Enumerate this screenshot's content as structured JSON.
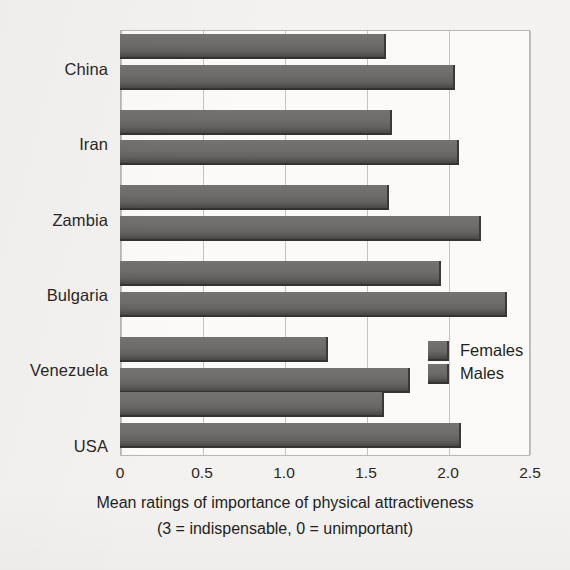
{
  "chart_data": {
    "type": "bar",
    "orientation": "horizontal",
    "title": "",
    "xlabel": "Mean ratings of importance of physical attractiveness",
    "xlabel_line2": "(3 = indispensable, 0 = unimportant)",
    "ylabel": "",
    "xlim": [
      0,
      2.5
    ],
    "xticks": [
      "0",
      "0.5",
      "1.0",
      "1.5",
      "2.0",
      "2.5"
    ],
    "xtick_values": [
      0,
      0.5,
      1.0,
      1.5,
      2.0,
      2.5
    ],
    "grid": true,
    "grid_axis": "x",
    "legend_position": "inside-right",
    "categories": [
      "China",
      "Iran",
      "Zambia",
      "Bulgaria",
      "Venezuela",
      "USA"
    ],
    "series": [
      {
        "name": "Females",
        "values": [
          1.62,
          1.66,
          1.64,
          1.96,
          1.27,
          1.61
        ]
      },
      {
        "name": "Males",
        "values": [
          2.04,
          2.07,
          2.2,
          2.36,
          1.77,
          2.08
        ]
      }
    ],
    "bar_color": "#6a6866",
    "bar_edge_color": "#3b3937",
    "plot_background": "#fbfaf9",
    "page_background": "#f3f2f0",
    "axis_color": "#b9b6b2",
    "gridline_color": "#c6c3bf",
    "text_color": "#231f1e"
  },
  "legend": {
    "items": [
      {
        "label": "Females"
      },
      {
        "label": "Males"
      }
    ]
  }
}
